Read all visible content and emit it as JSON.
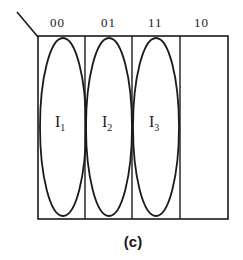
{
  "diagram": {
    "type": "karnaugh-map",
    "columns": [
      {
        "label": "00",
        "implicant": "I",
        "sub": "1"
      },
      {
        "label": "01",
        "implicant": "I",
        "sub": "2"
      },
      {
        "label": "11",
        "implicant": "I",
        "sub": "3"
      },
      {
        "label": "10",
        "implicant": "",
        "sub": ""
      }
    ],
    "caption": "(c)",
    "colors": {
      "line": "#1a1a1a",
      "background": "#ffffff"
    }
  }
}
